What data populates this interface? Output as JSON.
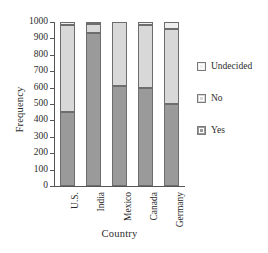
{
  "chart_data": {
    "type": "bar",
    "subtype": "stacked-bar",
    "title": "",
    "xlabel": "Country",
    "ylabel": "Frequency",
    "categories": [
      "U.S.",
      "India",
      "Mexico",
      "Canada",
      "Germany"
    ],
    "series": [
      {
        "name": "Yes",
        "color": "#9a9a9a",
        "values": [
          450,
          935,
          610,
          600,
          500
        ]
      },
      {
        "name": "No",
        "color": "#d8d8d8",
        "values": [
          530,
          55,
          390,
          380,
          460
        ]
      },
      {
        "name": "Undecided",
        "color": "#efefef",
        "values": [
          20,
          10,
          0,
          20,
          40
        ]
      }
    ],
    "stack_totals": [
      1000,
      1000,
      1000,
      1000,
      1000
    ],
    "ylim": [
      0,
      1000
    ],
    "ytick_step": 100,
    "yticks": [
      0,
      100,
      200,
      300,
      400,
      500,
      600,
      700,
      800,
      900,
      1000
    ],
    "ytick_labels": [
      "0",
      "100",
      "200",
      "300",
      "400",
      "500",
      "600",
      "700",
      "800",
      "900",
      "1000"
    ],
    "grid": false,
    "legend_position": "right",
    "legend_entries": [
      "Undecided",
      "No",
      "Yes"
    ],
    "xtick_label_rotation": 90
  },
  "axes": {
    "y_title": "Frequency",
    "x_title": "Country"
  },
  "legend": {
    "items": [
      {
        "label": "Undecided",
        "color": "#efefef"
      },
      {
        "label": "No",
        "color": "#d8d8d8"
      },
      {
        "label": "Yes",
        "color": "#9a9a9a"
      }
    ]
  }
}
